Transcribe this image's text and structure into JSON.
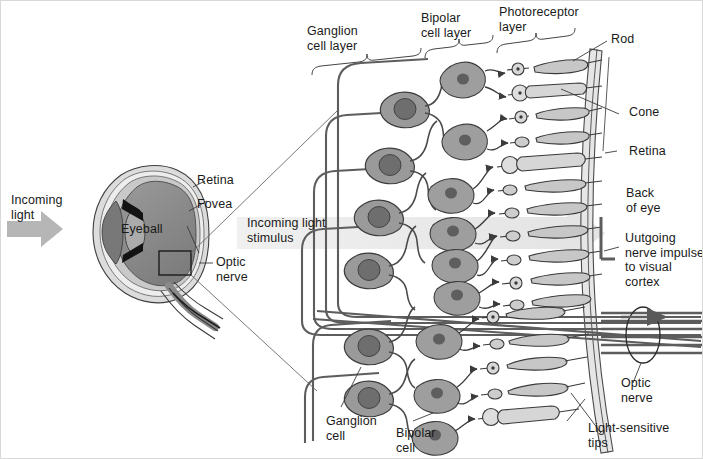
{
  "figure": {
    "width": 703,
    "height": 459,
    "background": "#ffffff"
  },
  "colors": {
    "outline": "#4a4a4a",
    "dark_outline": "#2b2b2b",
    "text": "#1a1a1a",
    "arrow_gray": "#b4b4b4",
    "light_beam": "#ebebeb",
    "cell_body_dark": "#8e8e8e",
    "cell_nucleus": "#6f6f6f",
    "cell_body_mid": "#a6a6a6",
    "photoreceptor_fill": "#cfcfcf",
    "retina_band": "#e2e2e2",
    "eye_sclera": "#d9d9d9",
    "eye_vitreous": "#8d8d8d",
    "eye_lens": "#a9a9a9",
    "eye_iris": "#1a1a1a",
    "nerve_bundle": "#5a5a5a"
  },
  "labels": {
    "incoming_light": "Incoming\nlight",
    "eyeball": "Eyeball",
    "retina_eye": "Retina",
    "fovea": "Fovea",
    "optic_nerve_eye": "Optic\nnerve",
    "incoming_light_stimulus": "Incoming light\nstimulus",
    "ganglion_cell_layer": "Ganglion\ncell layer",
    "bipolar_cell_layer": "Bipolar\ncell layer",
    "photoreceptor_layer": "Photoreceptor\nlayer",
    "rod": "Rod",
    "cone": "Cone",
    "retina_right": "Retina",
    "back_of_eye": "Back\nof eye",
    "outgoing_nerve_impulse": "Uutgoing\nnerve impulse\nto visual\ncortex",
    "optic_nerve_right": "Optic\nnerve",
    "ganglion_cell": "Ganglion\ncell",
    "bipolar_cell": "Bipolar\ncell",
    "light_sensitive_tips": "Light-sensitive\ntips"
  },
  "structures": {
    "braces": [
      "ganglion-cell-layer-brace",
      "bipolar-cell-layer-brace",
      "photoreceptor-layer-brace"
    ],
    "layer_count": 3,
    "ganglion_cells_upper": 4,
    "ganglion_cells_lower": 2,
    "bipolar_cells_upper": 6,
    "bipolar_cells_lower": 3,
    "photoreceptors_upper": 9,
    "photoreceptors_lower": 5,
    "nerve_fiber_lines": 6,
    "arrows": [
      "incoming-light-arrow",
      "light-stimulus-beam-arrow",
      "optic-nerve-impulse-arrow"
    ]
  }
}
